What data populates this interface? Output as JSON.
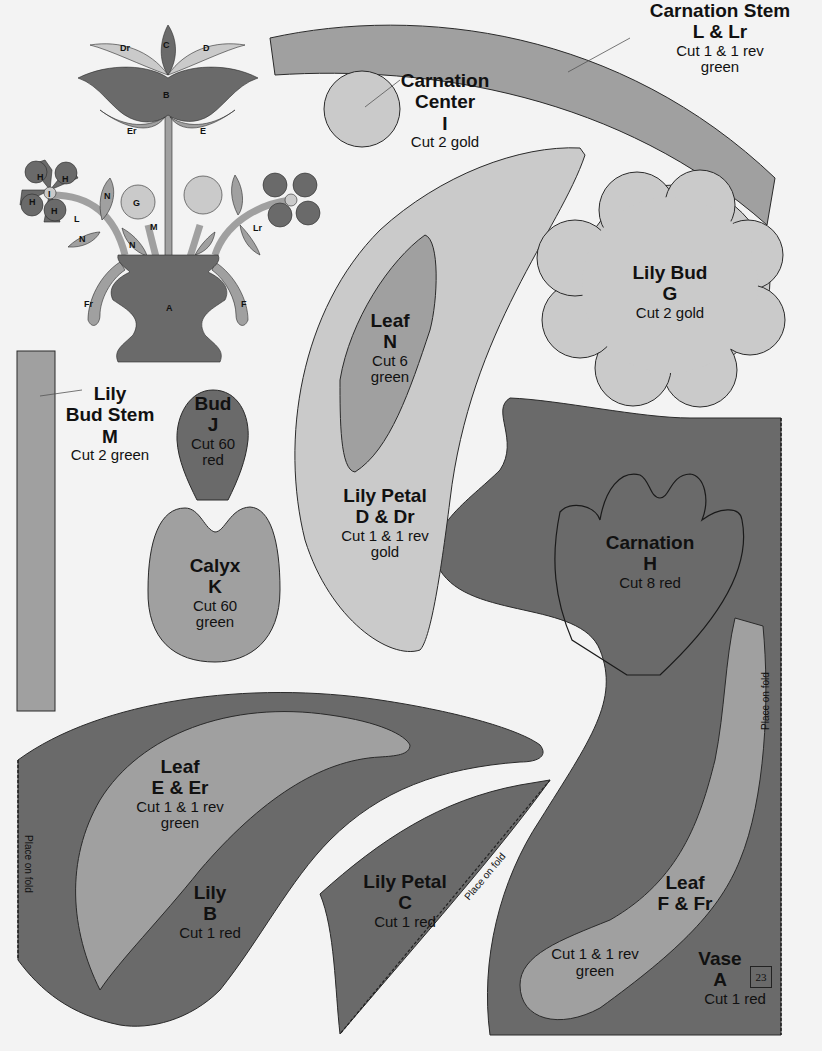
{
  "colors": {
    "background": "#f3f3f3",
    "red": "#6a6a6a",
    "green": "#a0a0a0",
    "gold": "#cacaca",
    "outline": "#2a2a2a"
  },
  "preview": {
    "title": "Lily vase appliqué block preview",
    "letters": [
      "Dr",
      "C",
      "D",
      "B",
      "Er",
      "E",
      "H",
      "H",
      "H",
      "H",
      "I",
      "L",
      "N",
      "N",
      "N",
      "G",
      "M",
      "Lr",
      "Fr",
      "F",
      "A"
    ]
  },
  "pieces": {
    "carnation_stem": {
      "title1": "Carnation Stem",
      "title2": "L & Lr",
      "cut1": "Cut 1 & 1 rev",
      "cut2": "green"
    },
    "carnation_center": {
      "title1": "Carnation",
      "title2": "Center",
      "title3": "I",
      "cut": "Cut 2 gold"
    },
    "lily_bud": {
      "title1": "Lily Bud",
      "title2": "G",
      "cut": "Cut 2 gold"
    },
    "leaf_n": {
      "title1": "Leaf",
      "title2": "N",
      "cut1": "Cut 6",
      "cut2": "green"
    },
    "lily_petal_d": {
      "title1": "Lily Petal",
      "title2": "D & Dr",
      "cut1": "Cut 1 & 1 rev",
      "cut2": "gold"
    },
    "lily_bud_stem": {
      "title1": "Lily",
      "title2": "Bud Stem",
      "title3": "M",
      "cut": "Cut 2 green"
    },
    "bud": {
      "title1": "Bud",
      "title2": "J",
      "cut1": "Cut 60",
      "cut2": "red"
    },
    "calyx": {
      "title1": "Calyx",
      "title2": "K",
      "cut1": "Cut 60",
      "cut2": "green"
    },
    "carnation": {
      "title1": "Carnation",
      "title2": "H",
      "cut": "Cut 8 red"
    },
    "leaf_e": {
      "title1": "Leaf",
      "title2": "E & Er",
      "cut1": "Cut 1 & 1 rev",
      "cut2": "green"
    },
    "lily": {
      "title1": "Lily",
      "title2": "B",
      "cut": "Cut 1 red"
    },
    "lily_petal_c": {
      "title1": "Lily Petal",
      "title2": "C",
      "cut": "Cut 1 red"
    },
    "leaf_f": {
      "title1": "Leaf",
      "title2": "F & Fr",
      "cut1": "Cut 1 & 1 rev",
      "cut2": "green"
    },
    "vase": {
      "title1": "Vase",
      "title2": "A",
      "cut": "Cut 1 red"
    }
  },
  "fold_labels": {
    "vase": "Place on fold",
    "lily": "Place on fold",
    "lily_petal_c": "Place on fold"
  },
  "page_number": "23"
}
